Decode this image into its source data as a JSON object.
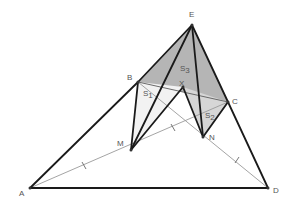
{
  "diagram": {
    "type": "geometry-figure",
    "points": {
      "A": {
        "label": "A",
        "x": 30,
        "y": 188
      },
      "B": {
        "label": "B",
        "x": 138,
        "y": 82
      },
      "C": {
        "label": "C",
        "x": 228,
        "y": 102
      },
      "D": {
        "label": "D",
        "x": 268,
        "y": 188
      },
      "E": {
        "label": "E",
        "x": 192,
        "y": 25
      },
      "X": {
        "label": "X",
        "x": 183,
        "y": 87
      },
      "M": {
        "label": "M",
        "x": 131,
        "y": 150
      },
      "N": {
        "label": "N",
        "x": 203,
        "y": 137
      }
    },
    "regions": {
      "S1": {
        "label": "S",
        "sub": "1"
      },
      "S2": {
        "label": "S",
        "sub": "2"
      },
      "S3": {
        "label": "S",
        "sub": "3"
      }
    },
    "colors": {
      "thick_line": "#1a1a1a",
      "thin_line": "#9a9a9a",
      "s3_fill": "#a8a8a8",
      "s2_fill": "#d6d6d6",
      "s1_fill": "#f2f2f2",
      "label": "#555555"
    }
  }
}
